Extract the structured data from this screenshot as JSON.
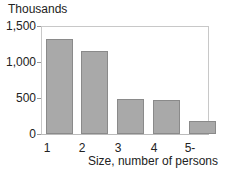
{
  "chart_data": {
    "type": "bar",
    "title": "",
    "ylabel": "Thousands",
    "xlabel": "Size, number of persons",
    "categories": [
      "1",
      "2",
      "3",
      "4",
      "5-"
    ],
    "values": [
      1320,
      1150,
      485,
      475,
      180
    ],
    "ylim": [
      0,
      1500
    ],
    "yticks": [
      "0",
      "500",
      "1,000",
      "1,500"
    ],
    "grid": false,
    "legend": null
  },
  "colors": {
    "bar": "#a9a9a9",
    "bar_border": "#8a8a8a",
    "axis": "#c8c8c8"
  }
}
